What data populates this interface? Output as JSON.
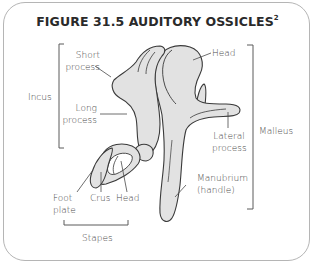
{
  "figure": {
    "title": "FIGURE 31.5 AUDITORY OSSICLES",
    "title_superscript": "2",
    "colors": {
      "bone_fill": "#e2e2e2",
      "bone_outline": "#3a3a3a",
      "label_text": "#4a4a4a",
      "title_text": "#2a2a2a",
      "frame_border": "#b5b5b5"
    }
  },
  "groups": {
    "incus": "Incus",
    "malleus": "Malleus",
    "stapes": "Stapes"
  },
  "labels": {
    "short_process": [
      "Short",
      "process"
    ],
    "long_process": [
      "Long",
      "process"
    ],
    "malleus_head": "Head",
    "lateral_process": [
      "Lateral",
      "process"
    ],
    "manubrium": [
      "Manubrium",
      "(handle)"
    ],
    "foot_plate": [
      "Foot",
      "plate"
    ],
    "crus": "Crus",
    "stapes_head": "Head"
  }
}
